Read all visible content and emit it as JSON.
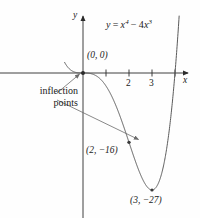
{
  "figure": {
    "background_color": "#fefefe",
    "curve_color": "#5a5a5a",
    "axis_color": "#2b2b2b",
    "leader_color": "#6b6b6b",
    "text_color": "#1a1a1a"
  },
  "axes": {
    "x_label": "x",
    "y_label": "y",
    "x_ticks": [
      {
        "value": 1,
        "label": ""
      },
      {
        "value": 2,
        "label": "2"
      },
      {
        "value": 3,
        "label": "3"
      },
      {
        "value": 4,
        "label": ""
      }
    ]
  },
  "equation": {
    "lhs": "y",
    "equals": "=",
    "base1": "x",
    "exp1": "4",
    "minus": "−",
    "coef2": "4",
    "base2": "x",
    "exp2": "3",
    "plain": "y = x⁴ − 4x³"
  },
  "annotations": {
    "origin_point": "(0, 0)",
    "inflection_note_line1": "inflection",
    "inflection_note_line2": "points",
    "point_2": "(2, −16)",
    "point_3": "(3, −27)"
  },
  "chart_data": {
    "type": "line",
    "xlabel": "x",
    "ylabel": "y",
    "expression": "x^4 - 4*x^3",
    "xlim": [
      -0.8,
      4.65
    ],
    "ylim": [
      -33.5,
      34
    ],
    "grid": false,
    "legend": "none",
    "x_ticks": [
      1,
      2,
      3,
      4
    ],
    "x_tick_labels": [
      "",
      "2",
      "3",
      ""
    ],
    "y_ticks": [],
    "y_tick_labels": [],
    "marked_points": [
      {
        "x": 0,
        "y": 0,
        "label": "(0, 0)",
        "kind": "inflection"
      },
      {
        "x": 2,
        "y": -16,
        "label": "(2, −16)",
        "kind": "inflection"
      },
      {
        "x": 3,
        "y": -27,
        "label": "(3, −27)",
        "kind": "minimum"
      }
    ],
    "annotations": [
      {
        "text": "inflection points",
        "points_to": [
          "(0, 0)",
          "(2, −16)"
        ]
      }
    ],
    "x": [
      -0.75,
      -0.6,
      -0.45,
      -0.3,
      -0.15,
      0,
      0.25,
      0.5,
      0.75,
      1,
      1.25,
      1.5,
      1.75,
      2,
      2.25,
      2.5,
      2.75,
      3,
      3.25,
      3.5,
      3.75,
      4,
      4.25,
      4.5
    ],
    "y": [
      1.99,
      1.0,
      0.41,
      0.11,
      0.014,
      0,
      -0.23,
      -1.69,
      -5.27,
      -12,
      -20.11,
      -26.72,
      -30.84,
      -32,
      -30.35,
      -26.48,
      -21.04,
      -16,
      -13.0,
      -14.28,
      -21.99,
      -40.1,
      -62.18,
      -91.1
    ]
  }
}
